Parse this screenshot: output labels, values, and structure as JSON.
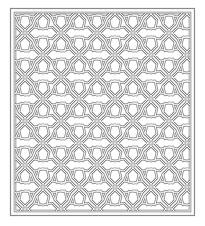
{
  "figure": {
    "colors": {
      "background": "#ffffff",
      "line_outer": "#8a8a8a",
      "line_inner": "#ffffff"
    },
    "frame": {
      "outer": {
        "x": 10,
        "y": 8,
        "width": 184,
        "height": 207
      },
      "inner": {
        "x": 15,
        "y": 13,
        "width": 175,
        "height": 198
      }
    },
    "tile": {
      "width": 36,
      "height": 44
    }
  }
}
